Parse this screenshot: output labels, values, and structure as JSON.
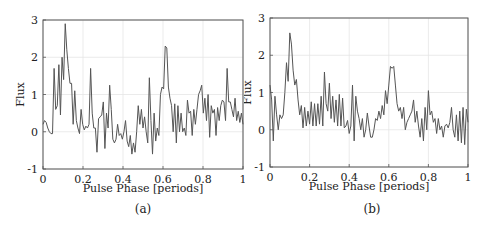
{
  "chart_data": [
    {
      "type": "line",
      "panel": "(a)",
      "caption": "(a)",
      "xlabel": "Pulse Phase [periods]",
      "ylabel": "Flux",
      "xlim": [
        0,
        1
      ],
      "ylim": [
        -1,
        3
      ],
      "xticks": [
        "0",
        "0.2",
        "0.4",
        "0.6",
        "0.8",
        "1"
      ],
      "yticks": [
        "-1",
        "0",
        "1",
        "2",
        "3"
      ],
      "grid": true,
      "line_color": "#555555",
      "y": [
        0.2,
        0.3,
        0.25,
        0.1,
        0.0,
        -0.05,
        -0.05,
        1.7,
        0.6,
        0.7,
        1.8,
        0.45,
        2.0,
        1.4,
        2.9,
        2.2,
        1.7,
        1.3,
        1.3,
        0.2,
        1.1,
        0.3,
        0.1,
        -0.05,
        0.6,
        0.2,
        0.05,
        0.15,
        0.1,
        0.2,
        1.7,
        0.5,
        0.1,
        0.1,
        -0.55,
        0.35,
        0.4,
        0.45,
        0.8,
        -0.45,
        0.5,
        0.1,
        1.25,
        0.6,
        -0.2,
        -0.3,
        -0.2,
        0.2,
        -0.1,
        -0.05,
        -0.2,
        0.0,
        0.3,
        -0.25,
        -0.4,
        -0.1,
        -0.6,
        -0.3,
        -0.55,
        0.0,
        0.7,
        0.2,
        0.6,
        0.1,
        0.4,
        0.0,
        -0.3,
        1.45,
        0.3,
        -0.6,
        0.5,
        -0.25,
        0.1,
        -0.1,
        1.0,
        1.2,
        1.15,
        2.3,
        2.25,
        1.2,
        0.9,
        0.7,
        0.0,
        0.75,
        -0.3,
        0.7,
        0.0,
        0.5,
        0.0,
        0.1,
        -0.1,
        0.85,
        0.5,
        0.55,
        -0.1,
        0.6,
        0.2,
        0.6,
        1.0,
        1.1,
        1.25,
        0.5,
        0.9,
        0.3,
        1.0,
        -0.15,
        0.7,
        0.5,
        0.6,
        -0.1,
        0.65,
        0.3,
        0.7,
        0.85,
        0.8,
        0.3,
        1.7,
        0.8,
        0.8,
        0.6,
        0.4,
        0.9,
        0.3,
        0.55,
        0.25,
        0.5,
        0.2
      ]
    },
    {
      "type": "line",
      "panel": "(b)",
      "caption": "(b)",
      "xlabel": "Pulse Phase [periods]",
      "ylabel": "Flux",
      "xlim": [
        0,
        1
      ],
      "ylim": [
        -1,
        3
      ],
      "xticks": [
        "0",
        "0.2",
        "0.4",
        "0.6",
        "0.8",
        "1"
      ],
      "yticks": [
        "-1",
        "0",
        "1",
        "2",
        "3"
      ],
      "grid": true,
      "line_color": "#555555",
      "y": [
        1.2,
        0.8,
        -0.3,
        0.9,
        0.4,
        0.0,
        0.4,
        0.3,
        0.4,
        1.0,
        1.8,
        1.3,
        2.6,
        2.3,
        1.6,
        1.2,
        1.35,
        0.8,
        0.4,
        0.65,
        0.05,
        0.6,
        0.1,
        0.5,
        0.15,
        0.75,
        0.1,
        0.7,
        0.1,
        0.7,
        0.15,
        0.9,
        0.1,
        1.55,
        0.7,
        0.5,
        1.25,
        0.3,
        0.9,
        0.2,
        0.8,
        0.1,
        0.95,
        0.1,
        0.85,
        0.05,
        0.1,
        0.25,
        -0.1,
        0.1,
        1.2,
        -0.3,
        0.9,
        0.5,
        0.3,
        0.0,
        0.3,
        -0.2,
        0.0,
        0.45,
        0.1,
        -0.2,
        -0.2,
        0.0,
        0.3,
        0.25,
        0.5,
        0.3,
        0.65,
        0.4,
        1.05,
        0.7,
        1.2,
        1.7,
        1.65,
        1.7,
        1.2,
        0.7,
        0.5,
        0.6,
        0.3,
        0.6,
        0.0,
        0.2,
        0.3,
        0.4,
        0.5,
        0.8,
        0.2,
        0.5,
        0.1,
        -0.2,
        0.3,
        -0.3,
        0.6,
        0.0,
        1.05,
        0.4,
        0.5,
        0.2,
        0.3,
        -0.1,
        0.3,
        0.0,
        0.1,
        -0.2,
        0.1,
        0.15,
        0.05,
        0.2,
        0.6,
        0.0,
        -0.2,
        0.4,
        -0.3,
        0.5,
        -0.35,
        0.6,
        -0.4,
        0.55,
        0.2
      ]
    }
  ]
}
